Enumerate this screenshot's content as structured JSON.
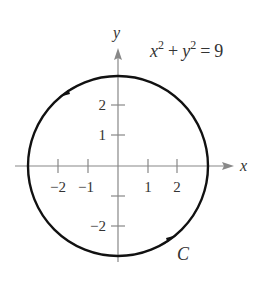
{
  "figure": {
    "equation": {
      "x": "x",
      "y": "y",
      "exp": "2",
      "plus": "+",
      "equals": "=",
      "rhs": "9"
    },
    "axes": {
      "x_label": "x",
      "y_label": "y",
      "x_ticks": [
        {
          "value": -2,
          "label": "−2"
        },
        {
          "value": -1,
          "label": "−1"
        },
        {
          "value": 1,
          "label": "1"
        },
        {
          "value": 2,
          "label": "2"
        }
      ],
      "y_ticks": [
        {
          "value": 2,
          "label": "2"
        },
        {
          "value": 1,
          "label": "1"
        },
        {
          "value": -1,
          "label": ""
        },
        {
          "value": -2,
          "label": "−2"
        }
      ]
    },
    "curve": {
      "name": "C",
      "radius": 3,
      "orientation": "counterclockwise"
    },
    "colors": {
      "curve": "#111111",
      "axis": "#777777",
      "text": "#333333"
    }
  }
}
